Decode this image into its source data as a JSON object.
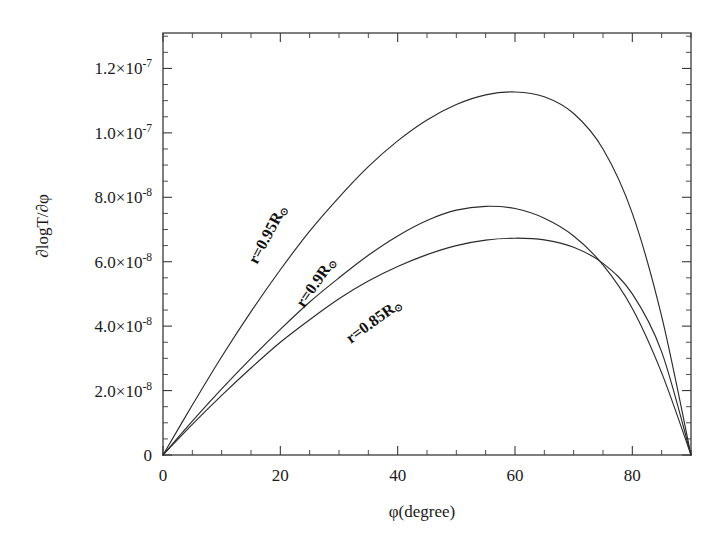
{
  "axes": {
    "x": {
      "label": "φ(degree)",
      "min": 0,
      "max": 90,
      "ticks": [
        0,
        20,
        40,
        60,
        80
      ],
      "tick_labels": [
        "0",
        "20",
        "40",
        "60",
        "80"
      ],
      "minor_step": 5
    },
    "y": {
      "label": "∂logT/∂φ",
      "min": 0,
      "max": 1.31e-07,
      "ticks": [
        0,
        2e-08,
        4e-08,
        6e-08,
        8e-08,
        1e-07,
        1.2e-07
      ],
      "tick_labels": [
        "0",
        "2.0×10",
        "4.0×10",
        "6.0×10",
        "8.0×10",
        "1.0×10",
        "1.2×10"
      ],
      "tick_exponents": [
        "",
        "-8",
        "-8",
        "-8",
        "-8",
        "-7",
        "-7"
      ],
      "minor_step": 5e-09
    }
  },
  "chart_data": {
    "type": "line",
    "title": "",
    "xlabel": "φ(degree)",
    "ylabel": "∂logT/∂φ",
    "xlim": [
      0,
      90
    ],
    "ylim": [
      0,
      1.31e-07
    ],
    "grid": false,
    "legend": "inline-curve-labels",
    "x": [
      0,
      5,
      10,
      15,
      20,
      25,
      30,
      35,
      40,
      45,
      50,
      55,
      60,
      65,
      70,
      75,
      80,
      85,
      90
    ],
    "series": [
      {
        "name": "r=0.95R⊙",
        "label": "r=0.95R",
        "label_suffix": "⊙",
        "label_x": 16,
        "label_y": 5.9e-08,
        "label_rotation": -62,
        "peak_x": 46,
        "peak_y": 1.127e-07,
        "values": [
          0,
          1.55e-08,
          3.05e-08,
          4.45e-08,
          5.75e-08,
          6.95e-08,
          8e-08,
          8.95e-08,
          9.75e-08,
          1.04e-07,
          1.088e-07,
          1.118e-07,
          1.127e-07,
          1.112e-07,
          1.06e-07,
          9.5e-08,
          7.5e-08,
          4.3e-08,
          0
        ]
      },
      {
        "name": "r=0.9R⊙",
        "label": "r=0.9R",
        "label_suffix": "⊙",
        "label_x": 24,
        "label_y": 4.55e-08,
        "label_rotation": -55,
        "peak_x": 42,
        "peak_y": 7.73e-08,
        "values": [
          0,
          1.05e-08,
          2.05e-08,
          3e-08,
          3.9e-08,
          4.75e-08,
          5.5e-08,
          6.2e-08,
          6.8e-08,
          7.28e-08,
          7.6e-08,
          7.72e-08,
          7.65e-08,
          7.35e-08,
          6.8e-08,
          5.9e-08,
          4.55e-08,
          2.55e-08,
          0
        ]
      },
      {
        "name": "r=0.85R⊙",
        "label": "r=0.85R",
        "label_suffix": "⊙",
        "label_x": 32,
        "label_y": 3.45e-08,
        "label_rotation": -36,
        "peak_x": 58,
        "peak_y": 6.73e-08,
        "values": [
          0,
          9.5e-09,
          1.85e-08,
          2.7e-08,
          3.5e-08,
          4.2e-08,
          4.85e-08,
          5.4e-08,
          5.85e-08,
          6.22e-08,
          6.5e-08,
          6.67e-08,
          6.73e-08,
          6.68e-08,
          6.45e-08,
          5.95e-08,
          5e-08,
          3.2e-08,
          0
        ]
      }
    ]
  }
}
